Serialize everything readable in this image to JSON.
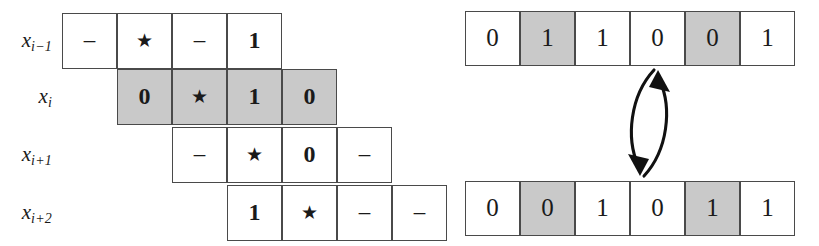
{
  "figure": {
    "shade_color": "#c9c9c9",
    "line_color": "#4a4a4a",
    "background": "#ffffff"
  },
  "left_grid": {
    "name": "offset-window-grid",
    "cell_width": 55,
    "cell_height": 56,
    "rows": [
      {
        "label": "x",
        "label_sub": "i−1",
        "offset_cells": 0,
        "shaded": false,
        "cells": [
          {
            "text": "–",
            "kind": "dash",
            "shaded": false
          },
          {
            "text": "★",
            "kind": "star",
            "shaded": false
          },
          {
            "text": "–",
            "kind": "dash",
            "shaded": false
          },
          {
            "text": "1",
            "kind": "digit",
            "shaded": false
          }
        ]
      },
      {
        "label": "x",
        "label_sub": "i",
        "offset_cells": 1,
        "shaded": true,
        "cells": [
          {
            "text": "0",
            "kind": "digit",
            "shaded": true
          },
          {
            "text": "★",
            "kind": "star",
            "shaded": true
          },
          {
            "text": "1",
            "kind": "digit",
            "shaded": true
          },
          {
            "text": "0",
            "kind": "digit",
            "shaded": true
          }
        ]
      },
      {
        "label": "x",
        "label_sub": "i+1",
        "offset_cells": 2,
        "shaded": false,
        "cells": [
          {
            "text": "–",
            "kind": "dash",
            "shaded": false
          },
          {
            "text": "★",
            "kind": "star",
            "shaded": false
          },
          {
            "text": "0",
            "kind": "digit",
            "shaded": false
          },
          {
            "text": "–",
            "kind": "dash",
            "shaded": false
          }
        ]
      },
      {
        "label": "x",
        "label_sub": "i+2",
        "offset_cells": 3,
        "shaded": false,
        "cells": [
          {
            "text": "1",
            "kind": "digit",
            "shaded": false
          },
          {
            "text": "★",
            "kind": "star",
            "shaded": false
          },
          {
            "text": "–",
            "kind": "dash",
            "shaded": false
          },
          {
            "text": "–",
            "kind": "dash",
            "shaded": false
          }
        ]
      }
    ]
  },
  "right_strips": {
    "name": "bit-string-pair",
    "cell_width": 55,
    "cell_height": 55,
    "top": {
      "name": "bit-string-top",
      "cells": [
        {
          "text": "0",
          "shaded": false
        },
        {
          "text": "1",
          "shaded": true
        },
        {
          "text": "1",
          "shaded": false
        },
        {
          "text": "0",
          "shaded": false
        },
        {
          "text": "0",
          "shaded": true
        },
        {
          "text": "1",
          "shaded": false
        }
      ]
    },
    "bottom": {
      "name": "bit-string-bottom",
      "cells": [
        {
          "text": "0",
          "shaded": false
        },
        {
          "text": "0",
          "shaded": true
        },
        {
          "text": "1",
          "shaded": false
        },
        {
          "text": "0",
          "shaded": false
        },
        {
          "text": "1",
          "shaded": true
        },
        {
          "text": "1",
          "shaded": false
        }
      ]
    },
    "arrow": {
      "name": "swap-double-arrow",
      "description": "curved double-headed arrow linking the two bit strings"
    }
  }
}
